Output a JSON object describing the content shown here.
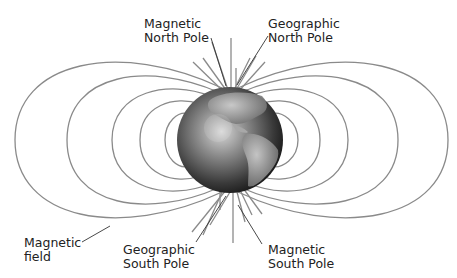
{
  "labels": {
    "magnetic_north": [
      "Magnetic",
      "North Pole"
    ],
    "geographic_north": [
      "Geographic",
      "North Pole"
    ],
    "magnetic_field": [
      "Magnetic",
      "field"
    ],
    "geographic_south": [
      "Geographic",
      "South Pole"
    ],
    "magnetic_south": [
      "Magnetic",
      "South Pole"
    ]
  },
  "colors": {
    "field_line": "#8a8a8a",
    "leader_line": "#333333",
    "globe_dark": "#1a1a1a",
    "globe_light": "#cfcfcf",
    "land": "#9a9a9a"
  }
}
